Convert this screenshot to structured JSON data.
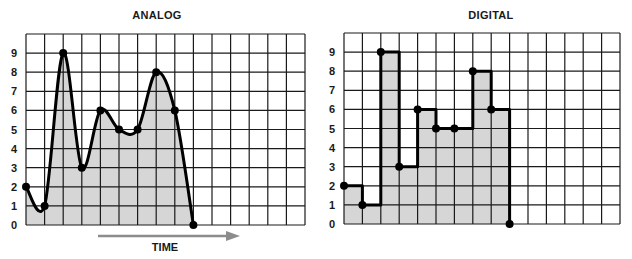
{
  "chart_data": [
    {
      "type": "line",
      "title": "ANALOG",
      "xlabel": "TIME",
      "ylabel": "",
      "x": [
        0,
        1,
        2,
        3,
        4,
        5,
        6,
        7,
        8,
        9
      ],
      "values": [
        2,
        1,
        9,
        3,
        6,
        5,
        5,
        8,
        6,
        0
      ],
      "yticks": [
        "0",
        "1",
        "2",
        "3",
        "4",
        "5",
        "6",
        "7",
        "8",
        "9"
      ],
      "ylim": [
        0,
        10
      ],
      "xlim": [
        0,
        15
      ],
      "grid": true,
      "interpolation": "smooth",
      "fill": "#d6d6d6",
      "line_color": "#000000",
      "arrow": {
        "label": "TIME",
        "direction": "right",
        "color": "#8c8c8c"
      }
    },
    {
      "type": "line",
      "title": "DIGITAL",
      "xlabel": "",
      "ylabel": "",
      "x": [
        0,
        1,
        2,
        3,
        4,
        5,
        6,
        7,
        8,
        9
      ],
      "values": [
        2,
        1,
        9,
        3,
        6,
        5,
        5,
        8,
        6,
        0
      ],
      "yticks": [
        "0",
        "1",
        "2",
        "3",
        "4",
        "5",
        "6",
        "7",
        "8",
        "9"
      ],
      "ylim": [
        0,
        10
      ],
      "xlim": [
        0,
        15
      ],
      "grid": true,
      "interpolation": "step",
      "fill": "#d6d6d6",
      "line_color": "#000000"
    }
  ],
  "panels": {
    "analog": {
      "title": "ANALOG",
      "time_label": "TIME"
    },
    "digital": {
      "title": "DIGITAL"
    }
  }
}
